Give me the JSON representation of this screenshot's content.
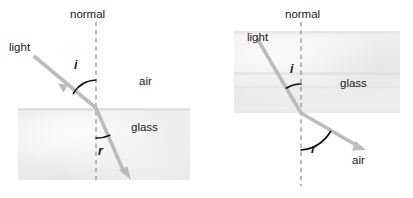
{
  "figure": {
    "background_color": "#ffffff",
    "ray_color": "#b9b9b9",
    "arc_color": "#111111",
    "text_color": "#1a1a1a",
    "glass_fill_color": "#e9e9e9",
    "normal_line_color": "#8c8c8c"
  },
  "diagrams": [
    {
      "id": "air-to-glass",
      "name": "light-entering-glass",
      "description": "Light travelling from air into glass bends toward the normal",
      "labels": {
        "normal": "normal",
        "light": "light",
        "angle_incidence": "i",
        "angle_refraction": "r",
        "medium_upper": "air",
        "medium_lower": "glass"
      },
      "geometry": {
        "boundary_y": 108,
        "incidence_point": [
          96,
          108
        ],
        "normal_top": [
          96,
          22
        ],
        "normal_bottom": [
          96,
          184
        ],
        "incident_ray_start": [
          35,
          57
        ],
        "refracted_ray_end": [
          128,
          178
        ],
        "glass_rect": [
          18,
          108,
          172,
          72
        ],
        "angle_incidence_deg": 48,
        "angle_refraction_deg": 28
      }
    },
    {
      "id": "glass-to-air",
      "name": "light-leaving-glass",
      "description": "Light travelling from glass into air bends away from the normal",
      "labels": {
        "normal": "normal",
        "light": "light",
        "angle_incidence": "i",
        "angle_refraction": "r",
        "medium_upper": "glass",
        "medium_lower": "air"
      },
      "geometry": {
        "boundary_y": 113,
        "incidence_point": [
          95,
          113
        ],
        "normal_top": [
          95,
          22
        ],
        "normal_bottom": [
          95,
          186
        ],
        "incident_ray_start": [
          52,
          40
        ],
        "refracted_ray_end": [
          155,
          148
        ],
        "glass_rect": [
          28,
          31,
          166,
          82
        ],
        "angle_incidence_deg": 26,
        "angle_refraction_deg": 46
      }
    }
  ]
}
